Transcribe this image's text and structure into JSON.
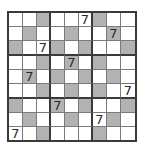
{
  "puzzle": {
    "size": 9,
    "box_size": 3,
    "colors": {
      "shaded": "#b2b2b2",
      "empty": "#ffffff",
      "grid_line": "#7a7a7a",
      "box_line": "#3a3a3a",
      "digit": "#2a2a2a"
    },
    "rows": [
      [
        {
          "v": "",
          "s": false
        },
        {
          "v": "",
          "s": false
        },
        {
          "v": "",
          "s": true
        },
        {
          "v": "",
          "s": false
        },
        {
          "v": "",
          "s": false
        },
        {
          "v": "7",
          "s": false
        },
        {
          "v": "",
          "s": true
        },
        {
          "v": "",
          "s": false
        },
        {
          "v": "",
          "s": false
        }
      ],
      [
        {
          "v": "",
          "s": false
        },
        {
          "v": "",
          "s": true
        },
        {
          "v": "",
          "s": false
        },
        {
          "v": "",
          "s": false
        },
        {
          "v": "",
          "s": true
        },
        {
          "v": "",
          "s": false
        },
        {
          "v": "",
          "s": false
        },
        {
          "v": "7",
          "s": true
        },
        {
          "v": "",
          "s": false
        }
      ],
      [
        {
          "v": "",
          "s": true
        },
        {
          "v": "",
          "s": false
        },
        {
          "v": "7",
          "s": false
        },
        {
          "v": "",
          "s": true
        },
        {
          "v": "",
          "s": false
        },
        {
          "v": "",
          "s": true
        },
        {
          "v": "",
          "s": false
        },
        {
          "v": "",
          "s": false
        },
        {
          "v": "",
          "s": true
        }
      ],
      [
        {
          "v": "",
          "s": false
        },
        {
          "v": "",
          "s": false
        },
        {
          "v": "",
          "s": true
        },
        {
          "v": "",
          "s": false
        },
        {
          "v": "7",
          "s": true
        },
        {
          "v": "",
          "s": false
        },
        {
          "v": "",
          "s": true
        },
        {
          "v": "",
          "s": false
        },
        {
          "v": "",
          "s": false
        }
      ],
      [
        {
          "v": "",
          "s": false
        },
        {
          "v": "7",
          "s": true
        },
        {
          "v": "",
          "s": false
        },
        {
          "v": "",
          "s": true
        },
        {
          "v": "",
          "s": false
        },
        {
          "v": "",
          "s": true
        },
        {
          "v": "",
          "s": false
        },
        {
          "v": "",
          "s": true
        },
        {
          "v": "",
          "s": false
        }
      ],
      [
        {
          "v": "",
          "s": false
        },
        {
          "v": "",
          "s": false
        },
        {
          "v": "",
          "s": true
        },
        {
          "v": "",
          "s": false
        },
        {
          "v": "",
          "s": true
        },
        {
          "v": "",
          "s": false
        },
        {
          "v": "",
          "s": true
        },
        {
          "v": "",
          "s": false
        },
        {
          "v": "7",
          "s": false
        }
      ],
      [
        {
          "v": "",
          "s": true
        },
        {
          "v": "",
          "s": false
        },
        {
          "v": "",
          "s": false
        },
        {
          "v": "7",
          "s": true
        },
        {
          "v": "",
          "s": false
        },
        {
          "v": "",
          "s": true
        },
        {
          "v": "",
          "s": false
        },
        {
          "v": "",
          "s": false
        },
        {
          "v": "",
          "s": true
        }
      ],
      [
        {
          "v": "",
          "s": false
        },
        {
          "v": "",
          "s": true
        },
        {
          "v": "",
          "s": false
        },
        {
          "v": "",
          "s": false
        },
        {
          "v": "",
          "s": true
        },
        {
          "v": "",
          "s": false
        },
        {
          "v": "7",
          "s": false
        },
        {
          "v": "",
          "s": true
        },
        {
          "v": "",
          "s": false
        }
      ],
      [
        {
          "v": "7",
          "s": false
        },
        {
          "v": "",
          "s": false
        },
        {
          "v": "",
          "s": true
        },
        {
          "v": "",
          "s": false
        },
        {
          "v": "",
          "s": false
        },
        {
          "v": "",
          "s": false
        },
        {
          "v": "",
          "s": true
        },
        {
          "v": "",
          "s": false
        },
        {
          "v": "",
          "s": false
        }
      ]
    ]
  }
}
